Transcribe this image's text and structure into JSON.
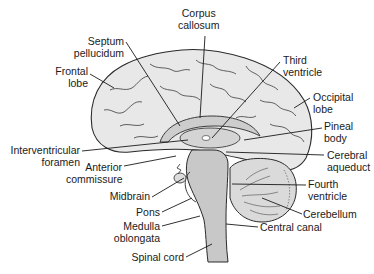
{
  "diagram": {
    "type": "anatomical-illustration",
    "colors": {
      "outline": "#2a2a2a",
      "cortex_fill": "#e6e6e6",
      "inner_fill": "#cfcfcf",
      "brainstem_fill": "#c4c4c4",
      "cerebellum_fill": "#d8d8d8",
      "background": "#ffffff"
    },
    "labels": [
      {
        "id": "corpus-callosum",
        "line1": "Corpus",
        "line2": "callosum"
      },
      {
        "id": "septum-pellucidum",
        "line1": "Septum",
        "line2": "pellucidum"
      },
      {
        "id": "frontal-lobe",
        "line1": "Frontal",
        "line2": "lobe"
      },
      {
        "id": "third-ventricle",
        "line1": "Third",
        "line2": "ventricle"
      },
      {
        "id": "occipital-lobe",
        "line1": "Occipital",
        "line2": "lobe"
      },
      {
        "id": "pineal-body",
        "line1": "Pineal",
        "line2": "body"
      },
      {
        "id": "interventricular-foramen",
        "line1": "Interventricular",
        "line2": "foramen"
      },
      {
        "id": "anterior-commissure",
        "line1": "Anterior",
        "line2": "commissure"
      },
      {
        "id": "cerebral-aqueduct",
        "line1": "Cerebral",
        "line2": "aqueduct"
      },
      {
        "id": "midbrain",
        "line1": "Midbrain"
      },
      {
        "id": "fourth-ventricle",
        "line1": "Fourth",
        "line2": "ventricle"
      },
      {
        "id": "pons",
        "line1": "Pons"
      },
      {
        "id": "cerebellum",
        "line1": "Cerebellum"
      },
      {
        "id": "medulla-oblongata",
        "line1": "Medulla",
        "line2": "oblongata"
      },
      {
        "id": "central-canal",
        "line1": "Central canal"
      },
      {
        "id": "spinal-cord",
        "line1": "Spinal cord"
      }
    ]
  }
}
